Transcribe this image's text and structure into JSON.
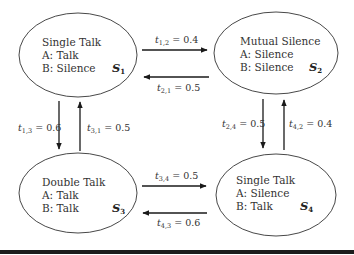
{
  "diagram": {
    "type": "state-transition",
    "states": [
      {
        "id": "S1",
        "symbol": "S",
        "index": "1",
        "title": "Single Talk",
        "a": "A: Talk",
        "b": "B: Silence",
        "cx": 78,
        "cy": 55,
        "rx": 59,
        "ry": 42
      },
      {
        "id": "S2",
        "symbol": "S",
        "index": "2",
        "title": "Mutual Silence",
        "a": "A: Silence",
        "b": "B: Silence",
        "cx": 276,
        "cy": 53,
        "rx": 62,
        "ry": 41
      },
      {
        "id": "S3",
        "symbol": "S",
        "index": "3",
        "title": "Double Talk",
        "a": "A: Talk",
        "b": "B: Talk",
        "cx": 78,
        "cy": 193,
        "rx": 59,
        "ry": 40
      },
      {
        "id": "S4",
        "symbol": "S",
        "index": "4",
        "title": "Single Talk",
        "a": "A: Silence",
        "b": "B: Talk",
        "cx": 276,
        "cy": 195,
        "rx": 60,
        "ry": 41
      }
    ],
    "transitions": [
      {
        "id": "t12",
        "from": "S1",
        "to": "S2",
        "sub": "1,2",
        "value": "0.4",
        "label": "t1,2 = 0.4"
      },
      {
        "id": "t21",
        "from": "S2",
        "to": "S1",
        "sub": "2,1",
        "value": "0.5",
        "label": "t2,1 = 0.5"
      },
      {
        "id": "t13",
        "from": "S1",
        "to": "S3",
        "sub": "1,3",
        "value": "0.6",
        "label": "t1,3 = 0.6"
      },
      {
        "id": "t31",
        "from": "S3",
        "to": "S1",
        "sub": "3,1",
        "value": "0.5",
        "label": "t3,1 = 0.5"
      },
      {
        "id": "t24",
        "from": "S2",
        "to": "S4",
        "sub": "2,4",
        "value": "0.5",
        "label": "t2,4 = 0.5"
      },
      {
        "id": "t42",
        "from": "S4",
        "to": "S2",
        "sub": "4,2",
        "value": "0.4",
        "label": "t4,2 = 0.4"
      },
      {
        "id": "t34",
        "from": "S3",
        "to": "S4",
        "sub": "3,4",
        "value": "0.5",
        "label": "t3,4 = 0.5"
      },
      {
        "id": "t43",
        "from": "S4",
        "to": "S3",
        "sub": "4,3",
        "value": "0.6",
        "label": "t4,3 = 0.6"
      }
    ],
    "label_prefix": "t",
    "label_eq": " = "
  }
}
